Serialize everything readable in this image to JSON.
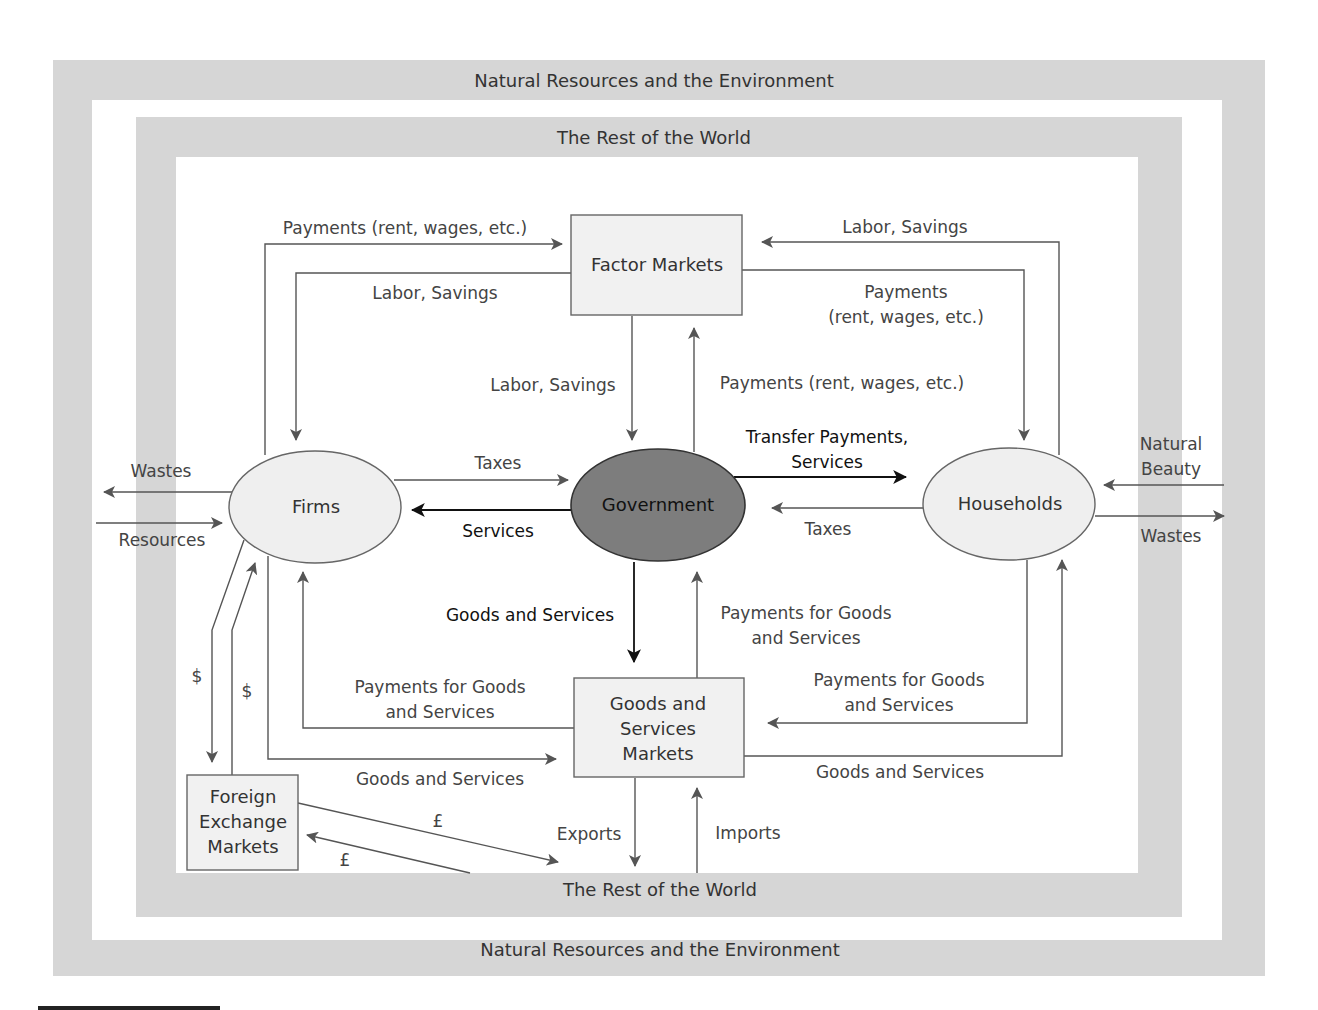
{
  "colors": {
    "band": "#d6d6d6",
    "node_fill": "#efefef",
    "government_fill": "#7d7d7d",
    "line": "#555555",
    "line_dark": "#111111"
  },
  "bands": {
    "outer_top": "Natural Resources and the Environment",
    "inner_top": "The Rest of the World",
    "inner_bottom": "The Rest of the World",
    "outer_bottom": "Natural Resources and the Environment"
  },
  "nodes": {
    "factor_markets": "Factor Markets",
    "firms": "Firms",
    "government": "Government",
    "households": "Households",
    "goods_markets": [
      "Goods and",
      "Services",
      "Markets"
    ],
    "forex": [
      "Foreign",
      "Exchange",
      "Markets"
    ]
  },
  "flows": {
    "firms_to_factor_payments": "Payments (rent, wages, etc.)",
    "factor_to_firms_labor": "Labor, Savings",
    "households_to_factor_labor": "Labor, Savings",
    "factor_to_households_payments": [
      "Payments",
      "(rent, wages, etc.)"
    ],
    "factor_to_gov_labor": "Labor, Savings",
    "gov_to_factor_payments": "Payments (rent, wages, etc.)",
    "firms_to_gov_taxes": "Taxes",
    "gov_to_firms_services": "Services",
    "gov_to_households_transfers": [
      "Transfer Payments,",
      "Services"
    ],
    "households_to_gov_taxes": "Taxes",
    "firms_wastes": "Wastes",
    "firms_resources": "Resources",
    "households_natural_beauty": [
      "Natural",
      "Beauty"
    ],
    "households_wastes": "Wastes",
    "gov_to_goods_goods": "Goods and Services",
    "goods_to_gov_payments": [
      "Payments for Goods",
      "and Services"
    ],
    "goods_to_firms_payments": [
      "Payments for Goods",
      "and Services"
    ],
    "firms_to_goods_goods": "Goods and Services",
    "households_to_goods_payments": [
      "Payments for Goods",
      "and Services"
    ],
    "goods_to_households_goods": "Goods and Services",
    "firms_to_forex_dollar": "$",
    "forex_to_firms_dollar": "$",
    "forex_to_world_pound": "£",
    "world_to_forex_pound": "£",
    "exports": "Exports",
    "imports": "Imports"
  }
}
